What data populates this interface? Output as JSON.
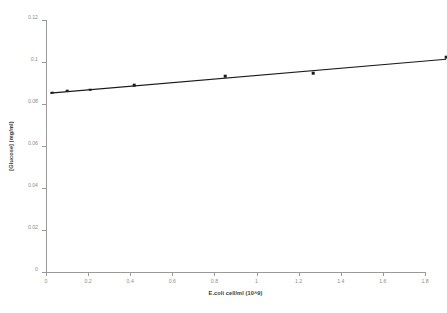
{
  "chart_data": {
    "type": "scatter",
    "title": "",
    "xlabel": "E.coli cell/ml (10^9)",
    "ylabel": "[Glucose] (mg/ml)",
    "xlim": [
      0,
      1.8
    ],
    "ylim": [
      0,
      0.12
    ],
    "grid": false,
    "legend": "none",
    "xticks": [
      "0",
      "0.2",
      "0.4",
      "0.6",
      "0.8",
      "1",
      "1.2",
      "1.4",
      "1.6",
      "1.8"
    ],
    "xtick_values": [
      0,
      0.2,
      0.4,
      0.6,
      0.8,
      1,
      1.2,
      1.4,
      1.6,
      1.8
    ],
    "yticks": [
      "0",
      "0.02",
      "0.04",
      "0.06",
      "0.08",
      "0.1",
      "0.12"
    ],
    "ytick_values": [
      0,
      0.02,
      0.04,
      0.06,
      0.08,
      0.1,
      0.12
    ],
    "series": [
      {
        "name": "Glucose concentration",
        "marker": "square",
        "color": "#1a1a1a",
        "points": [
          {
            "x": 0.03,
            "y": 0.0853
          },
          {
            "x": 0.1,
            "y": 0.0864
          },
          {
            "x": 0.21,
            "y": 0.0868
          },
          {
            "x": 0.42,
            "y": 0.089
          },
          {
            "x": 0.85,
            "y": 0.0932
          },
          {
            "x": 1.27,
            "y": 0.0948
          },
          {
            "x": 1.9,
            "y": 0.1022
          }
        ]
      }
    ],
    "trendline": {
      "type": "linear",
      "color": "#1a1a1a",
      "x_start": 0.02,
      "y_start": 0.0852,
      "x_end": 1.9,
      "y_end": 0.1013
    }
  }
}
